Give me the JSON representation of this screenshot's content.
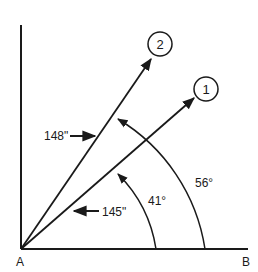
{
  "diagram": {
    "points": {
      "vertex_label": "A",
      "baseline_end_label": "B"
    },
    "vectors": [
      {
        "id": "1",
        "label": "1",
        "angle_label": "41°",
        "length_label": "145\""
      },
      {
        "id": "2",
        "label": "2",
        "angle_label": "56°",
        "length_label": "148\""
      }
    ],
    "colors": {
      "stroke": "#1a1a1a",
      "background": "#ffffff"
    }
  }
}
